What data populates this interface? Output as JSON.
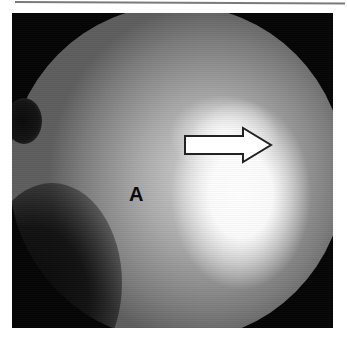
{
  "figure": {
    "annotations": {
      "label": "A",
      "arrow": "arrow-right-outline"
    }
  }
}
